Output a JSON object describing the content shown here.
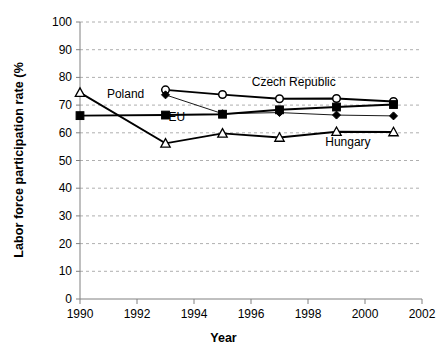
{
  "chart_data": {
    "type": "line",
    "title": "",
    "xlabel": "Year",
    "ylabel": "Labor force participation rate (%",
    "xlim": [
      1990,
      2002
    ],
    "ylim": [
      0,
      100
    ],
    "xticks": [
      1990,
      1992,
      1994,
      1996,
      1998,
      2000,
      2002
    ],
    "yticks": [
      0,
      10,
      20,
      30,
      40,
      50,
      60,
      70,
      80,
      90,
      100
    ],
    "grid": "horizontal-dashed",
    "legend": "inline-annotations",
    "series": [
      {
        "name": "Czech Republic",
        "marker": "circle-open",
        "x": [
          1993,
          1995,
          1997,
          1999,
          2001
        ],
        "values": [
          75.5,
          73.8,
          72.3,
          72.4,
          71.3
        ]
      },
      {
        "name": "EU",
        "marker": "square-filled",
        "x": [
          1990,
          1993,
          1995,
          1997,
          1999,
          2001
        ],
        "values": [
          66.2,
          66.4,
          66.7,
          68.3,
          69.3,
          70.2
        ]
      },
      {
        "name": "Poland",
        "marker": "diamond-filled",
        "x": [
          1993,
          1995,
          1997,
          1999,
          2001
        ],
        "values": [
          73.7,
          66.9,
          67.3,
          66.4,
          66.1
        ]
      },
      {
        "name": "Hungary",
        "marker": "triangle-open",
        "x": [
          1990,
          1993,
          1995,
          1997,
          1999,
          2001
        ],
        "values": [
          74.5,
          56.2,
          59.8,
          58.3,
          60.4,
          60.3
        ]
      }
    ],
    "annotations": [
      {
        "text": "Poland",
        "x": 1991.6,
        "y": 72.4
      },
      {
        "text": "EU",
        "x": 1993.4,
        "y": 64.3
      },
      {
        "text": "Czech Republic",
        "x": 1997.5,
        "y": 77.0
      },
      {
        "text": "Hungary",
        "x": 1999.4,
        "y": 55.2
      }
    ],
    "colors": {
      "line": "#000000",
      "grid": "#9a9a9a",
      "axis": "#808080",
      "background": "#ffffff"
    }
  }
}
